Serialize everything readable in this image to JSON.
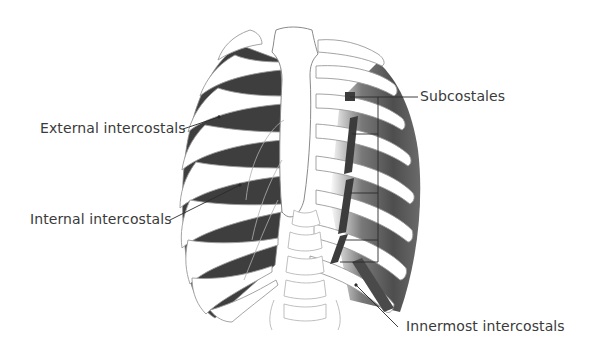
{
  "figure": {
    "colors": {
      "bone_fill": "#ffffff",
      "bone_outline": "#9a9a9a",
      "muscle_dark": "#3c3c3c",
      "muscle_mid": "#5a5a5a",
      "leader_line": "#2a2a2a",
      "label_text": "#3a3a3a"
    },
    "labels": [
      {
        "id": "external-intercostals",
        "text": "External intercostals"
      },
      {
        "id": "internal-intercostals",
        "text": "Internal intercostals"
      },
      {
        "id": "subcostales",
        "text": "Subcostales"
      },
      {
        "id": "innermost-intercostals",
        "text": "Innermost intercostals"
      }
    ]
  }
}
